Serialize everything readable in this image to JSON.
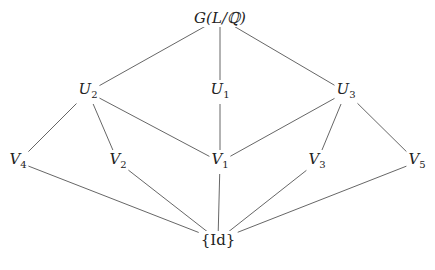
{
  "diagram": {
    "type": "subgroup-lattice",
    "nodes": [
      {
        "id": "G",
        "label": "G(L/ℚ)",
        "base": "G(L/ℚ)",
        "sub": "",
        "x": 220,
        "y": 18,
        "upright": false
      },
      {
        "id": "U2",
        "label": "U2",
        "base": "U",
        "sub": "2",
        "x": 88,
        "y": 92,
        "upright": false
      },
      {
        "id": "U1",
        "label": "U1",
        "base": "U",
        "sub": "1",
        "x": 220,
        "y": 92,
        "upright": false
      },
      {
        "id": "U3",
        "label": "U3",
        "base": "U",
        "sub": "3",
        "x": 346,
        "y": 92,
        "upright": false
      },
      {
        "id": "V4",
        "label": "V4",
        "base": "V",
        "sub": "4",
        "x": 18,
        "y": 162,
        "upright": false
      },
      {
        "id": "V2",
        "label": "V2",
        "base": "V",
        "sub": "2",
        "x": 118,
        "y": 162,
        "upright": false
      },
      {
        "id": "V1",
        "label": "V1",
        "base": "V",
        "sub": "1",
        "x": 220,
        "y": 162,
        "upright": false
      },
      {
        "id": "V3",
        "label": "V3",
        "base": "V",
        "sub": "3",
        "x": 317,
        "y": 162,
        "upright": false
      },
      {
        "id": "V5",
        "label": "V5",
        "base": "V",
        "sub": "5",
        "x": 417,
        "y": 162,
        "upright": false
      },
      {
        "id": "Id",
        "label": "{Id}",
        "base": "{Id}",
        "sub": "",
        "x": 218,
        "y": 240,
        "upright": true
      }
    ],
    "edges": [
      [
        "G",
        "U2"
      ],
      [
        "G",
        "U1"
      ],
      [
        "G",
        "U3"
      ],
      [
        "U2",
        "V4"
      ],
      [
        "U2",
        "V2"
      ],
      [
        "U2",
        "V1"
      ],
      [
        "U1",
        "V1"
      ],
      [
        "U3",
        "V1"
      ],
      [
        "U3",
        "V3"
      ],
      [
        "U3",
        "V5"
      ],
      [
        "V4",
        "Id"
      ],
      [
        "V2",
        "Id"
      ],
      [
        "V1",
        "Id"
      ],
      [
        "V3",
        "Id"
      ],
      [
        "V5",
        "Id"
      ]
    ],
    "colors": {
      "line": "#555555",
      "text": "#222222",
      "background": "#ffffff"
    }
  }
}
